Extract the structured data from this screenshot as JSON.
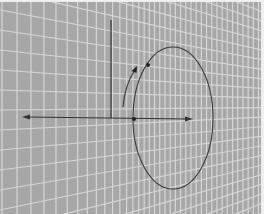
{
  "diagram": {
    "colors": {
      "background": "#a7a7a7",
      "grid_line": "#d8d8d8",
      "stroke": "#333333",
      "edge": "#eeeeee"
    },
    "elements": [
      {
        "name": "vertical-axis",
        "type": "line"
      },
      {
        "name": "horizontal-axis",
        "type": "double-arrow"
      },
      {
        "name": "rotation-circle",
        "type": "ellipse"
      },
      {
        "name": "rotation-arrow",
        "type": "curved-arrow"
      },
      {
        "name": "origin-point",
        "type": "dot"
      },
      {
        "name": "circle-point",
        "type": "dot"
      }
    ]
  }
}
